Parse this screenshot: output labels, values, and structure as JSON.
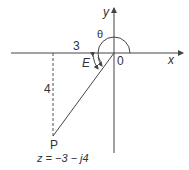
{
  "diagram": {
    "type": "argand-diagram",
    "axes": {
      "x_label": "x",
      "y_label": "y",
      "origin_label": "0"
    },
    "point": {
      "label": "P",
      "equation": "z = −3 − j4",
      "real": -3,
      "imag": -4
    },
    "labels": {
      "horizontal_length": "3",
      "vertical_length": "4",
      "theta": "θ",
      "angle_e": "E"
    },
    "colors": {
      "stroke": "#444444",
      "text": "#333333"
    }
  }
}
